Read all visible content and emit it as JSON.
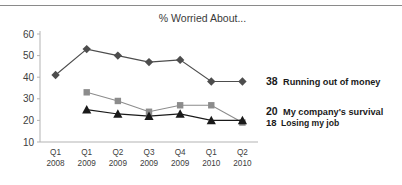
{
  "chart_data": {
    "type": "line",
    "title": "% Worried About...",
    "xlabel": "",
    "ylabel": "",
    "ylim": [
      10,
      60
    ],
    "yticks": [
      10,
      20,
      30,
      40,
      50,
      60
    ],
    "grid": false,
    "legend_position": "right-inline",
    "categories": [
      "Q1 2008",
      "Q1 2009",
      "Q2 2009",
      "Q3 2009",
      "Q4 2009",
      "Q1 2010",
      "Q2 2010"
    ],
    "category_lines": [
      [
        "Q1",
        "2008"
      ],
      [
        "Q1",
        "2009"
      ],
      [
        "Q2",
        "2009"
      ],
      [
        "Q3",
        "2009"
      ],
      [
        "Q4",
        "2009"
      ],
      [
        "Q1",
        "2010"
      ],
      [
        "Q2",
        "2010"
      ]
    ],
    "series": [
      {
        "name": "Running out of money",
        "marker": "diamond",
        "color": "#4d4d4d",
        "end_value": 38,
        "values": [
          41,
          53,
          50,
          47,
          48,
          38,
          38
        ]
      },
      {
        "name": "My company's survival",
        "marker": "square",
        "color": "#8c8c8c",
        "end_value": 20,
        "values": [
          null,
          33,
          29,
          24,
          27,
          27,
          19
        ]
      },
      {
        "name": "Losing my job",
        "marker": "triangle",
        "color": "#1a1a1a",
        "end_value": 18,
        "values": [
          null,
          25,
          23,
          22,
          23,
          20,
          20
        ]
      }
    ],
    "annotations": [
      {
        "value": "38",
        "label": "Running out of money"
      },
      {
        "value": "20",
        "label": "My company's survival"
      },
      {
        "value": "18",
        "label": "Losing my job"
      }
    ]
  },
  "colors": {
    "axis": "#b3b3b3",
    "top_rule": "#8a8a8a",
    "text": "#404040",
    "annotation": "#1a1a1a",
    "series_diamond": "#4d4d4d",
    "series_square": "#8c8c8c",
    "series_triangle": "#1a1a1a"
  }
}
